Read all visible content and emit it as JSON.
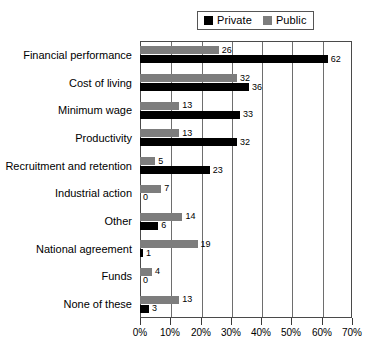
{
  "chart_data": {
    "type": "bar",
    "orientation": "horizontal",
    "title": "",
    "subtitle": "",
    "xlabel": "",
    "ylabel": "",
    "xlim": [
      0,
      70
    ],
    "xtick_values": [
      0,
      10,
      20,
      30,
      40,
      50,
      60,
      70
    ],
    "xtick_labels": [
      "0%",
      "10%",
      "20%",
      "30%",
      "40%",
      "50%",
      "60%",
      "70%"
    ],
    "grid": "vertical",
    "legend_position": "top-center",
    "categories": [
      "Financial performance",
      "Cost of living",
      "Minimum wage",
      "Productivity",
      "Recruitment and retention",
      "Industrial action",
      "Other",
      "National agreement",
      "Funds",
      "None of these"
    ],
    "series": [
      {
        "name": "Private",
        "color": "#000000",
        "values": [
          62,
          36,
          33,
          32,
          23,
          0,
          6,
          1,
          0,
          3
        ]
      },
      {
        "name": "Public",
        "color": "#7d7d7d",
        "values": [
          26,
          32,
          13,
          13,
          5,
          7,
          14,
          19,
          4,
          13
        ]
      }
    ]
  },
  "legend": {
    "items": [
      {
        "label": "Private",
        "color": "#000000",
        "swatch_name": "legend-swatch-private"
      },
      {
        "label": "Public",
        "color": "#7d7d7d",
        "swatch_name": "legend-swatch-public"
      }
    ]
  }
}
